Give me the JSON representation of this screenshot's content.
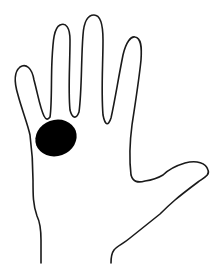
{
  "figure": {
    "marker": "black oval spot on palm near base of index finger",
    "colors": {
      "background": "#ffffff",
      "outline": "#1a1a1a",
      "marker": "#000000"
    }
  }
}
